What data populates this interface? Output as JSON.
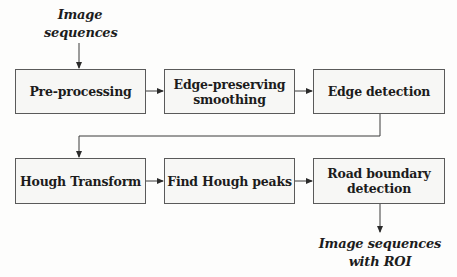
{
  "diagram": {
    "type": "flowchart",
    "input_label": {
      "line1": "Image",
      "line2": "sequences"
    },
    "output_label": {
      "line1": "Image sequences",
      "line2": "with ROI"
    },
    "nodes": [
      {
        "id": "pre-processing",
        "line1": "Pre-processing",
        "line2": ""
      },
      {
        "id": "edge-preserving-smoothing",
        "line1": "Edge-preserving",
        "line2": "smoothing"
      },
      {
        "id": "edge-detection",
        "line1": "Edge detection",
        "line2": ""
      },
      {
        "id": "hough-transform",
        "line1": "Hough Transform",
        "line2": ""
      },
      {
        "id": "find-hough-peaks",
        "line1": "Find Hough peaks",
        "line2": ""
      },
      {
        "id": "road-boundary-detection",
        "line1": "Road boundary",
        "line2": "detection"
      }
    ],
    "edges": [
      {
        "from": "input",
        "to": "pre-processing"
      },
      {
        "from": "pre-processing",
        "to": "edge-preserving-smoothing"
      },
      {
        "from": "edge-preserving-smoothing",
        "to": "edge-detection"
      },
      {
        "from": "edge-detection",
        "to": "hough-transform"
      },
      {
        "from": "hough-transform",
        "to": "find-hough-peaks"
      },
      {
        "from": "find-hough-peaks",
        "to": "road-boundary-detection"
      },
      {
        "from": "road-boundary-detection",
        "to": "output"
      }
    ],
    "colors": {
      "line": "#3a3a3a",
      "box_border": "#5a5a5a",
      "box_fill": "#f7f7f5",
      "text": "#1c1c1c"
    }
  }
}
